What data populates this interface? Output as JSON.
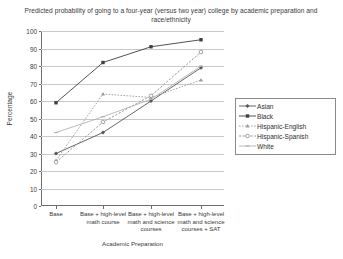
{
  "chart_data": {
    "type": "line",
    "title": "Predicted probability of going to a four-year (versus two year) college by academic preparation and race/ethnicity",
    "xlabel": "Academic Preparation",
    "ylabel": "Percentage",
    "ylim": [
      0,
      100
    ],
    "ytick_step": 10,
    "grid": true,
    "legend_position": "right",
    "categories": [
      "Base",
      "Base + high-level math course",
      "Base + high-level math and science courses",
      "Base + high-level math and science courses + SAT"
    ],
    "yticks": [
      "0",
      "10",
      "20",
      "30",
      "40",
      "50",
      "60",
      "70",
      "80",
      "90",
      "100"
    ],
    "series": [
      {
        "name": "Asian",
        "marker": "diamond",
        "values": [
          30,
          42,
          60,
          79
        ]
      },
      {
        "name": "Black",
        "marker": "square",
        "values": [
          59,
          82,
          91,
          95
        ]
      },
      {
        "name": "Hispanic-English",
        "marker": "triangle",
        "values": [
          26,
          64,
          62,
          72
        ]
      },
      {
        "name": "Hispanic-Spanish",
        "marker": "open-circle",
        "values": [
          25,
          48,
          63,
          88
        ]
      },
      {
        "name": "White",
        "marker": "dash",
        "values": [
          42,
          51,
          61,
          80
        ]
      }
    ]
  },
  "colors": {
    "axis": "#6d6d6d",
    "grid": "#c9c9c9",
    "text": "#3a3a3a",
    "series_dark": "#3a3a3a",
    "series_mid": "#6f6f6f",
    "series_light": "#a9a9a9"
  }
}
